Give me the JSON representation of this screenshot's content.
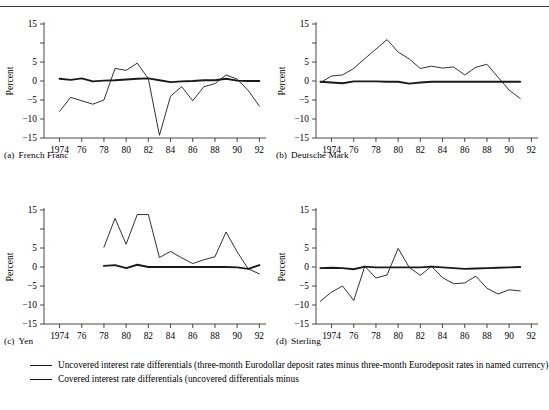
{
  "figure": {
    "ylabel": "Percent",
    "y_ticks": [
      15,
      10,
      5,
      0,
      -5,
      -10,
      -15
    ],
    "y_tick_labels": [
      "15",
      "",
      "5",
      "0",
      "−5",
      "−10",
      "−15"
    ],
    "ylim": [
      -15,
      15
    ],
    "x_ticks": [
      1974,
      1976,
      1978,
      1980,
      1982,
      1984,
      1986,
      1988,
      1990,
      1992
    ],
    "x_tick_labels": [
      "1974",
      "76",
      "78",
      "80",
      "82",
      "84",
      "86",
      "88",
      "90",
      "92"
    ],
    "xlim": [
      1972.6,
      1992.6
    ],
    "grid": false,
    "line_color": "#1a1a1a"
  },
  "legend": {
    "entries": [
      {
        "style": "thin",
        "name": "uncovered-differentials",
        "text": "Uncovered interest rate differentials (three-month Eurodollar deposit rates minus three-month Eurodeposit rates in named currency)"
      },
      {
        "style": "thick",
        "name": "covered-differentials",
        "text": "Covered interest rate differentials (uncovered differentials minus"
      }
    ]
  },
  "panels": [
    {
      "id": "a",
      "index": "(a)",
      "title": "French Franc"
    },
    {
      "id": "b",
      "index": "(b)",
      "title": "Deutsche Mark"
    },
    {
      "id": "c",
      "index": "(c)",
      "title": "Yen"
    },
    {
      "id": "d",
      "index": "(d)",
      "title": "Sterling"
    }
  ],
  "chart_data": [
    {
      "type": "line",
      "panel": "(a)",
      "title": "French Franc",
      "xlabel": "",
      "ylabel": "Percent",
      "ylim": [
        -15,
        15
      ],
      "xlim": [
        1972.6,
        1992.6
      ],
      "grid": false,
      "legend_position": "below-figure",
      "series": [
        {
          "name": "Uncovered interest rate differentials",
          "style": "thin",
          "x": [
            1974,
            1975,
            1976,
            1977,
            1978,
            1979,
            1980,
            1981,
            1982,
            1983,
            1984,
            1985,
            1986,
            1987,
            1988,
            1989,
            1990,
            1991,
            1992
          ],
          "values": [
            -8.0,
            -4.3,
            -5.2,
            -6.1,
            -5.0,
            3.3,
            2.8,
            4.7,
            0.6,
            -14.3,
            -4.0,
            -1.5,
            -5.2,
            -1.5,
            -0.7,
            1.6,
            0.5,
            -2.5,
            -6.6
          ]
        },
        {
          "name": "Covered interest rate differentials",
          "style": "thick",
          "x": [
            1974,
            1975,
            1976,
            1977,
            1978,
            1979,
            1980,
            1981,
            1982,
            1983,
            1984,
            1985,
            1986,
            1987,
            1988,
            1989,
            1990,
            1991,
            1992
          ],
          "values": [
            0.6,
            0.3,
            0.7,
            -0.1,
            0.1,
            0.2,
            0.4,
            0.6,
            0.7,
            0.2,
            -0.3,
            -0.1,
            0.0,
            0.2,
            0.2,
            0.6,
            0.1,
            0.0,
            0.0
          ]
        }
      ]
    },
    {
      "type": "line",
      "panel": "(b)",
      "title": "Deutsche Mark",
      "xlabel": "",
      "ylabel": "Percent",
      "ylim": [
        -15,
        15
      ],
      "xlim": [
        1972.6,
        1992.6
      ],
      "grid": false,
      "legend_position": "below-figure",
      "series": [
        {
          "name": "Uncovered interest rate differentials",
          "style": "thin",
          "x": [
            1973,
            1974,
            1975,
            1976,
            1977,
            1978,
            1979,
            1980,
            1981,
            1982,
            1983,
            1984,
            1985,
            1986,
            1987,
            1988,
            1989,
            1990,
            1991
          ],
          "values": [
            -0.4,
            1.3,
            1.6,
            3.3,
            5.9,
            8.4,
            10.9,
            7.6,
            5.8,
            3.3,
            3.9,
            3.4,
            3.7,
            1.6,
            3.6,
            4.4,
            1.0,
            -2.4,
            -4.6
          ]
        },
        {
          "name": "Covered interest rate differentials",
          "style": "thick",
          "x": [
            1973,
            1974,
            1975,
            1976,
            1977,
            1978,
            1979,
            1980,
            1981,
            1982,
            1983,
            1984,
            1985,
            1986,
            1987,
            1988,
            1989,
            1990,
            1991
          ],
          "values": [
            -0.2,
            -0.4,
            -0.6,
            -0.1,
            -0.1,
            -0.1,
            -0.2,
            -0.2,
            -0.7,
            -0.4,
            -0.2,
            -0.2,
            -0.2,
            -0.2,
            -0.2,
            -0.2,
            -0.2,
            -0.2,
            -0.2
          ]
        }
      ]
    },
    {
      "type": "line",
      "panel": "(c)",
      "title": "Yen",
      "xlabel": "",
      "ylabel": "Percent",
      "ylim": [
        -15,
        15
      ],
      "xlim": [
        1972.6,
        1992.6
      ],
      "grid": false,
      "legend_position": "below-figure",
      "series": [
        {
          "name": "Uncovered interest rate differentials",
          "style": "thin",
          "x": [
            1978,
            1979,
            1980,
            1981,
            1982,
            1983,
            1984,
            1985,
            1986,
            1987,
            1988,
            1989,
            1990,
            1991,
            1992
          ],
          "values": [
            5.2,
            12.8,
            6.0,
            13.8,
            13.8,
            2.5,
            4.1,
            2.4,
            0.9,
            1.9,
            2.7,
            9.2,
            4.0,
            -0.5,
            -1.8
          ]
        },
        {
          "name": "Covered interest rate differentials",
          "style": "thick",
          "x": [
            1978,
            1979,
            1980,
            1981,
            1982,
            1983,
            1984,
            1985,
            1986,
            1987,
            1988,
            1989,
            1990,
            1991,
            1992
          ],
          "values": [
            0.3,
            0.5,
            -0.3,
            0.6,
            0.0,
            0.0,
            0.0,
            0.0,
            0.0,
            0.0,
            0.0,
            0.0,
            -0.1,
            -0.5,
            0.5
          ]
        }
      ]
    },
    {
      "type": "line",
      "panel": "(d)",
      "title": "Sterling",
      "xlabel": "",
      "ylabel": "Percent",
      "ylim": [
        -15,
        15
      ],
      "xlim": [
        1972.6,
        1992.6
      ],
      "grid": false,
      "legend_position": "below-figure",
      "series": [
        {
          "name": "Uncovered interest rate differentials",
          "style": "thin",
          "x": [
            1973,
            1974,
            1975,
            1976,
            1977,
            1978,
            1979,
            1980,
            1981,
            1982,
            1983,
            1984,
            1985,
            1986,
            1987,
            1988,
            1989,
            1990,
            1991
          ],
          "values": [
            -9.0,
            -6.6,
            -5.0,
            -8.8,
            0.2,
            -2.9,
            -2.1,
            4.9,
            -0.1,
            -2.2,
            0.2,
            -2.8,
            -4.4,
            -4.2,
            -2.4,
            -5.6,
            -7.1,
            -6.0,
            -6.3
          ]
        },
        {
          "name": "Covered interest rate differentials",
          "style": "thick",
          "x": [
            1973,
            1974,
            1975,
            1976,
            1977,
            1978,
            1979,
            1980,
            1981,
            1982,
            1983,
            1984,
            1985,
            1986,
            1987,
            1988,
            1989,
            1990,
            1991
          ],
          "values": [
            -0.3,
            -0.2,
            -0.3,
            -0.6,
            0.1,
            -0.1,
            -0.1,
            -0.1,
            -0.1,
            -0.1,
            0.1,
            -0.1,
            -0.3,
            -0.5,
            -0.4,
            -0.3,
            -0.2,
            -0.1,
            0.0
          ]
        }
      ]
    }
  ]
}
